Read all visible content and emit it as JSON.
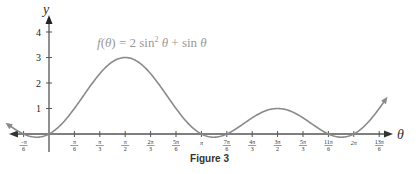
{
  "chart_data": {
    "type": "line",
    "title": "",
    "function_label": "f(θ) = 2 sin² θ + sin θ",
    "xlabel": "θ",
    "ylabel": "y",
    "x_tick_labels": [
      {
        "num": "−π",
        "den": "6",
        "k": -1
      },
      {
        "num": "π",
        "den": "6",
        "k": 1
      },
      {
        "num": "π",
        "den": "3",
        "k": 2
      },
      {
        "num": "π",
        "den": "2",
        "k": 3
      },
      {
        "num": "2π",
        "den": "3",
        "k": 4
      },
      {
        "num": "5π",
        "den": "6",
        "k": 5
      },
      {
        "num": "π",
        "den": "",
        "k": 6
      },
      {
        "num": "7π",
        "den": "6",
        "k": 7
      },
      {
        "num": "4π",
        "den": "3",
        "k": 8
      },
      {
        "num": "3π",
        "den": "2",
        "k": 9
      },
      {
        "num": "5π",
        "den": "3",
        "k": 10
      },
      {
        "num": "11π",
        "den": "6",
        "k": 11
      },
      {
        "num": "2π",
        "den": "",
        "k": 12
      },
      {
        "num": "13π",
        "den": "6",
        "k": 13
      }
    ],
    "y_ticks": [
      1,
      2,
      3,
      4
    ],
    "xlim_units_of_pi_over_6": [
      -1.5,
      13.5
    ],
    "ylim": [
      0,
      4.5
    ],
    "grid": false,
    "legend": null,
    "key_points": [
      {
        "x": "−π/6",
        "y": -0.5
      },
      {
        "x": "0",
        "y": 0
      },
      {
        "x": "π/2",
        "y": 3
      },
      {
        "x": "π",
        "y": 0
      },
      {
        "x": "7π/6",
        "y": 0
      },
      {
        "x": "3π/2",
        "y": 1
      },
      {
        "x": "11π/6",
        "y": 0
      },
      {
        "x": "2π",
        "y": 0
      }
    ],
    "line_color": "#8a8a8a",
    "axis_color": "#555555"
  },
  "caption": "Figure 3"
}
